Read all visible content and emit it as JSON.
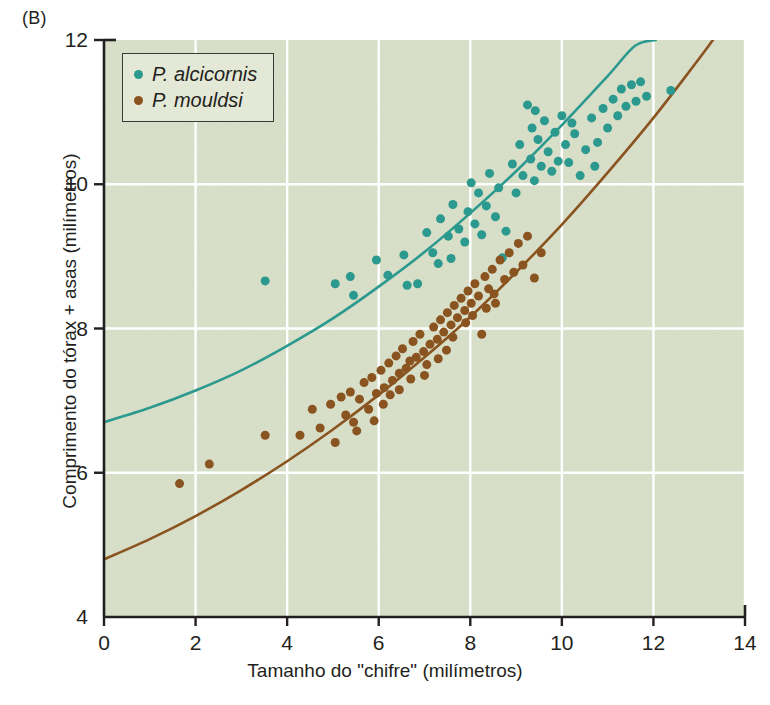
{
  "figure": {
    "panel_label": "(B)",
    "background_color": "#e3e8d6",
    "grid_color": "#ffffff",
    "axis_color": "#231f20"
  },
  "legend": {
    "position": "top-left-inside",
    "entries": [
      {
        "label": "P. alcicornis",
        "color": "#2b998e",
        "marker": "filled-circle"
      },
      {
        "label": "P. mouldsi",
        "color": "#8a5420",
        "marker": "filled-circle"
      }
    ]
  },
  "chart_data": {
    "type": "scatter",
    "title": "",
    "xlabel": "Tamanho do \"chifre\" (milímetros)",
    "ylabel": "Comprimento do tórax + asas (milímetros)",
    "xlim": [
      0,
      14
    ],
    "ylim": [
      4,
      12
    ],
    "xticks": [
      0,
      2,
      4,
      6,
      8,
      10,
      12,
      14
    ],
    "yticks": [
      4,
      6,
      8,
      10,
      12
    ],
    "xtick_labels": [
      "0",
      "2",
      "4",
      "6",
      "8",
      "10",
      "12",
      "14"
    ],
    "ytick_labels": [
      "4",
      "6",
      "8",
      "10",
      "12"
    ],
    "grid": true,
    "grid_axes": "both",
    "series": [
      {
        "name": "P. alcicornis",
        "color": "#2b998e",
        "marker": "filled-circle",
        "marker_size": 9,
        "points": [
          [
            3.52,
            8.66
          ],
          [
            5.05,
            8.62
          ],
          [
            5.38,
            8.72
          ],
          [
            5.45,
            8.46
          ],
          [
            5.95,
            8.95
          ],
          [
            6.2,
            8.74
          ],
          [
            6.55,
            9.02
          ],
          [
            6.62,
            8.6
          ],
          [
            6.85,
            8.62
          ],
          [
            7.05,
            9.33
          ],
          [
            7.18,
            9.05
          ],
          [
            7.3,
            8.9
          ],
          [
            7.35,
            9.52
          ],
          [
            7.52,
            9.28
          ],
          [
            7.58,
            8.97
          ],
          [
            7.62,
            9.72
          ],
          [
            7.75,
            9.38
          ],
          [
            7.88,
            9.2
          ],
          [
            7.95,
            9.62
          ],
          [
            8.02,
            10.02
          ],
          [
            8.1,
            9.45
          ],
          [
            8.18,
            9.88
          ],
          [
            8.25,
            9.3
          ],
          [
            8.35,
            9.7
          ],
          [
            8.42,
            10.15
          ],
          [
            8.55,
            9.55
          ],
          [
            8.62,
            9.95
          ],
          [
            8.7,
            8.98
          ],
          [
            8.78,
            9.35
          ],
          [
            8.92,
            10.28
          ],
          [
            9.0,
            9.88
          ],
          [
            9.08,
            10.55
          ],
          [
            9.15,
            10.12
          ],
          [
            9.25,
            11.1
          ],
          [
            9.32,
            10.35
          ],
          [
            9.4,
            10.05
          ],
          [
            9.48,
            10.62
          ],
          [
            9.55,
            10.25
          ],
          [
            9.62,
            10.88
          ],
          [
            9.7,
            10.45
          ],
          [
            9.78,
            10.18
          ],
          [
            9.85,
            10.72
          ],
          [
            9.92,
            10.32
          ],
          [
            10.0,
            10.95
          ],
          [
            10.08,
            10.55
          ],
          [
            10.15,
            10.3
          ],
          [
            10.28,
            10.7
          ],
          [
            10.4,
            10.12
          ],
          [
            10.52,
            10.48
          ],
          [
            10.65,
            10.92
          ],
          [
            10.78,
            10.58
          ],
          [
            10.9,
            11.05
          ],
          [
            11.0,
            10.78
          ],
          [
            11.12,
            11.18
          ],
          [
            11.22,
            10.95
          ],
          [
            11.3,
            11.32
          ],
          [
            11.4,
            11.08
          ],
          [
            11.52,
            11.38
          ],
          [
            11.62,
            11.15
          ],
          [
            11.72,
            11.42
          ],
          [
            11.85,
            11.22
          ],
          [
            12.38,
            11.3
          ],
          [
            9.35,
            10.78
          ],
          [
            9.42,
            11.02
          ],
          [
            10.22,
            10.85
          ],
          [
            10.72,
            10.25
          ]
        ]
      },
      {
        "name": "P. mouldsi",
        "color": "#8a5420",
        "marker": "filled-circle",
        "marker_size": 9,
        "points": [
          [
            1.65,
            5.85
          ],
          [
            2.3,
            6.12
          ],
          [
            3.52,
            6.52
          ],
          [
            4.28,
            6.52
          ],
          [
            4.55,
            6.88
          ],
          [
            4.72,
            6.62
          ],
          [
            4.95,
            6.95
          ],
          [
            5.05,
            6.42
          ],
          [
            5.18,
            7.05
          ],
          [
            5.28,
            6.8
          ],
          [
            5.38,
            7.12
          ],
          [
            5.45,
            6.7
          ],
          [
            5.58,
            7.02
          ],
          [
            5.68,
            7.25
          ],
          [
            5.78,
            6.88
          ],
          [
            5.85,
            7.32
          ],
          [
            5.95,
            7.1
          ],
          [
            6.05,
            7.42
          ],
          [
            6.12,
            7.18
          ],
          [
            6.22,
            7.52
          ],
          [
            6.3,
            7.28
          ],
          [
            6.38,
            7.62
          ],
          [
            6.45,
            7.38
          ],
          [
            6.52,
            7.72
          ],
          [
            6.6,
            7.45
          ],
          [
            6.68,
            7.55
          ],
          [
            6.75,
            7.82
          ],
          [
            6.82,
            7.6
          ],
          [
            6.9,
            7.92
          ],
          [
            6.98,
            7.68
          ],
          [
            7.05,
            7.5
          ],
          [
            7.12,
            7.78
          ],
          [
            7.2,
            8.02
          ],
          [
            7.28,
            7.85
          ],
          [
            7.35,
            8.12
          ],
          [
            7.42,
            7.95
          ],
          [
            7.5,
            8.22
          ],
          [
            7.58,
            8.05
          ],
          [
            7.65,
            8.32
          ],
          [
            7.72,
            8.15
          ],
          [
            7.8,
            8.42
          ],
          [
            7.88,
            8.25
          ],
          [
            7.95,
            8.52
          ],
          [
            8.02,
            8.35
          ],
          [
            8.1,
            8.62
          ],
          [
            8.18,
            8.45
          ],
          [
            8.25,
            7.92
          ],
          [
            8.32,
            8.72
          ],
          [
            8.4,
            8.55
          ],
          [
            8.48,
            8.82
          ],
          [
            8.55,
            8.35
          ],
          [
            8.65,
            8.95
          ],
          [
            8.75,
            8.68
          ],
          [
            8.85,
            9.05
          ],
          [
            8.95,
            8.78
          ],
          [
            9.05,
            9.18
          ],
          [
            9.15,
            8.88
          ],
          [
            9.25,
            9.28
          ],
          [
            9.4,
            8.7
          ],
          [
            9.55,
            9.05
          ],
          [
            6.1,
            6.95
          ],
          [
            6.25,
            7.08
          ],
          [
            6.45,
            7.15
          ],
          [
            6.7,
            7.3
          ],
          [
            7.0,
            7.35
          ],
          [
            7.3,
            7.58
          ],
          [
            7.48,
            7.7
          ],
          [
            7.62,
            7.88
          ],
          [
            7.9,
            8.08
          ],
          [
            8.05,
            8.18
          ],
          [
            5.52,
            6.58
          ],
          [
            5.9,
            6.72
          ],
          [
            8.35,
            8.28
          ],
          [
            8.52,
            8.48
          ]
        ]
      }
    ],
    "fit_curves": [
      {
        "name": "P. alcicornis fit",
        "color": "#2b998e",
        "style": "solid",
        "width": 2.6,
        "points": [
          [
            0.0,
            6.7
          ],
          [
            1.0,
            6.9
          ],
          [
            2.0,
            7.14
          ],
          [
            3.0,
            7.42
          ],
          [
            4.0,
            7.76
          ],
          [
            5.0,
            8.14
          ],
          [
            6.0,
            8.58
          ],
          [
            7.0,
            9.06
          ],
          [
            8.0,
            9.6
          ],
          [
            9.0,
            10.18
          ],
          [
            10.0,
            10.82
          ],
          [
            11.0,
            11.5
          ],
          [
            11.6,
            11.92
          ],
          [
            12.05,
            12.0
          ]
        ]
      },
      {
        "name": "P. mouldsi fit",
        "color": "#8a5420",
        "style": "solid",
        "width": 2.6,
        "points": [
          [
            0.0,
            4.8
          ],
          [
            1.0,
            5.08
          ],
          [
            2.0,
            5.4
          ],
          [
            3.0,
            5.76
          ],
          [
            4.0,
            6.16
          ],
          [
            5.0,
            6.6
          ],
          [
            6.0,
            7.08
          ],
          [
            7.0,
            7.6
          ],
          [
            8.0,
            8.16
          ],
          [
            9.0,
            8.78
          ],
          [
            10.0,
            9.44
          ],
          [
            11.0,
            10.16
          ],
          [
            12.0,
            10.92
          ],
          [
            12.9,
            11.66
          ],
          [
            13.3,
            12.0
          ]
        ]
      }
    ]
  }
}
